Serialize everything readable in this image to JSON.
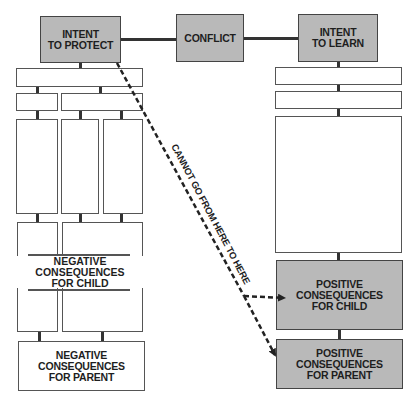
{
  "diagram": {
    "top_row": {
      "intent_protect": "INTENT\nTO PROTECT",
      "conflict": "CONFLICT",
      "intent_learn": "INTENT\nTO LEARN"
    },
    "left_column": {
      "negative_child": "NEGATIVE\nCONSEQUENCES\nFOR CHILD",
      "negative_parent": "NEGATIVE\nCONSEQUENCES\nFOR PARENT"
    },
    "right_column": {
      "positive_child": "POSITIVE\nCONSEQUENCES\nFOR CHILD",
      "positive_parent": "POSITIVE\nCONSEQUENCES\nFOR PARENT"
    },
    "arrow_label": "CANNOT GO FROM HERE TO HERE",
    "colors": {
      "highlight_fill": "#b9b9b9",
      "outline": "#555555",
      "text": "#1e1e1e"
    }
  }
}
